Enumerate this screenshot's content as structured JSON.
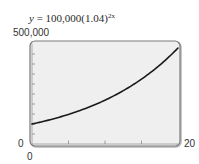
{
  "title": {
    "prefix_var": "y",
    "equals": " = 100,000(1.04)",
    "exponent": "2x",
    "full": "y = 100,000(1.04)^2x"
  },
  "axes": {
    "y_max_label": "500,000",
    "y_min_label": "0",
    "x_min_label": "0",
    "x_max_label": "20"
  },
  "colors": {
    "plot_background": "#efefef",
    "frame": "#7a7a7a",
    "frame_shadow": "#b5b5b5",
    "curve": "#1a1a1a",
    "ticks": "#8a8a8a"
  },
  "chart_data": {
    "type": "line",
    "xlabel": "",
    "ylabel": "",
    "xlim": [
      0,
      20
    ],
    "ylim": [
      0,
      500000
    ],
    "x_ticks": [
      0,
      5,
      10,
      15,
      20
    ],
    "x_tick_labels_shown": [
      "0",
      "20"
    ],
    "y_ticks": [
      0,
      50000,
      100000,
      150000,
      200000,
      250000,
      300000,
      350000,
      400000,
      450000,
      500000
    ],
    "y_tick_labels_shown": [
      "0",
      "500,000"
    ],
    "grid": false,
    "legend": null,
    "series": [
      {
        "name": "y = 100,000(1.04)^2x",
        "x": [
          0,
          2,
          4,
          6,
          8,
          10,
          12,
          14,
          16,
          18,
          20
        ],
        "values": [
          100000,
          116986,
          136857,
          160103,
          187298,
          219112,
          256330,
          299870,
          350806,
          410393,
          480102
        ]
      }
    ]
  }
}
